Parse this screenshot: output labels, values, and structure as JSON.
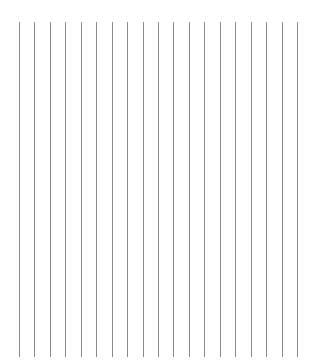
{
  "pattern": {
    "description": "vertical ruled lines",
    "line_count": 19,
    "line_color": "#8a8a8a",
    "background_color": "#ffffff"
  }
}
